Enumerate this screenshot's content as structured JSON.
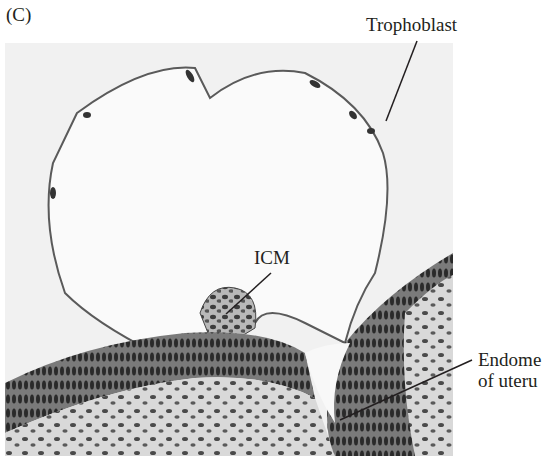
{
  "figure": {
    "panel_label": "(C)",
    "labels": {
      "trophoblast": "Trophoblast",
      "icm": "ICM",
      "endometrium_line1": "Endome",
      "endometrium_line2": "of uteru"
    },
    "colors": {
      "text": "#231f20",
      "background": "#ffffff",
      "tissue_dark": "#3a3a3a",
      "tissue_mid": "#8c8c8c",
      "tissue_light": "#d6d6d6",
      "cavity": "#f7f7f7"
    }
  }
}
